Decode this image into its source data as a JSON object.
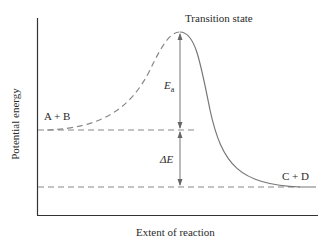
{
  "diagram": {
    "y_axis_label": "Potential energy",
    "x_axis_label": "Extent of reaction",
    "peak_label": "Transition state",
    "reactants_label": "A + B",
    "products_label": "C + D",
    "activation_energy": {
      "symbol": "E",
      "subscript": "a"
    },
    "energy_change": {
      "symbol": "ΔE"
    }
  },
  "colors": {
    "curve": "#888888",
    "axis": "#333333",
    "text": "#2a2a2a"
  }
}
